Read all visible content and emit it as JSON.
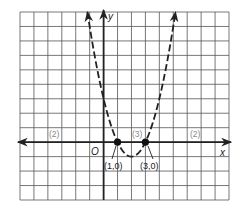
{
  "chart_data": {
    "type": "line",
    "title": "",
    "function": "y = (x - 1)(x - 3)",
    "xlabel": "x",
    "ylabel": "y",
    "origin_label": "O",
    "xlim": [
      -6,
      9
    ],
    "ylim": [
      -4,
      9
    ],
    "grid": true,
    "series": [
      {
        "name": "parabola",
        "style": "dashed",
        "x": [
          -1.16,
          -1,
          0,
          1,
          2,
          3,
          4,
          5,
          5.16
        ],
        "y": [
          9,
          8,
          3,
          0,
          -1,
          0,
          3,
          8,
          9
        ]
      }
    ],
    "points": [
      {
        "x": 1,
        "y": 0,
        "label": "(1,0)"
      },
      {
        "x": 3,
        "y": 0,
        "label": "(3,0)"
      }
    ],
    "annotations": [
      {
        "text": "(2)",
        "x": -3.5,
        "y": 0.5
      },
      {
        "text": "(3)",
        "x": 2.3,
        "y": 0.5
      },
      {
        "text": "(2)",
        "x": 6.9,
        "y": 0.5
      }
    ]
  },
  "labels": {
    "x_axis": "x",
    "y_axis": "y",
    "origin": "O",
    "point1": "(1,0)",
    "point2": "(3,0)",
    "interval_left": "(2)",
    "interval_mid": "(3)",
    "interval_right": "(2)"
  }
}
